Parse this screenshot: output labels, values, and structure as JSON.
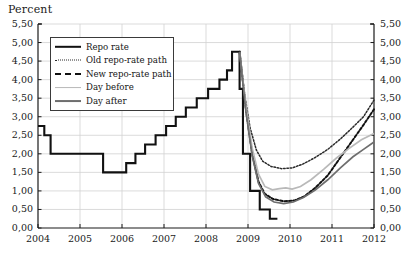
{
  "chart_data": {
    "type": "line",
    "title": "",
    "ylabel": "Percent",
    "xlabel": "",
    "ylim": [
      0,
      5.5
    ],
    "xlim": [
      2004,
      2012
    ],
    "grid": true,
    "legend_position": "top-left",
    "ytick_labels": [
      "0,00",
      "0,50",
      "1,00",
      "1,50",
      "2,00",
      "2,50",
      "3,00",
      "3,50",
      "4,00",
      "4,50",
      "5,00",
      "5,50"
    ],
    "ytick_values": [
      0,
      0.5,
      1,
      1.5,
      2,
      2.5,
      3,
      3.5,
      4,
      4.5,
      5,
      5.5
    ],
    "xtick_labels": [
      "2004",
      "2005",
      "2006",
      "2007",
      "2008",
      "2009",
      "2010",
      "2011",
      "2012"
    ],
    "xtick_values": [
      2004,
      2005,
      2006,
      2007,
      2008,
      2009,
      2010,
      2011,
      2012
    ],
    "series": [
      {
        "name": "Repo rate",
        "style": "solid-step",
        "color": "#111111",
        "width": 2.1,
        "points": [
          [
            2004.0,
            2.75
          ],
          [
            2004.15,
            2.75
          ],
          [
            2004.15,
            2.5
          ],
          [
            2004.3,
            2.5
          ],
          [
            2004.3,
            2.0
          ],
          [
            2005.55,
            2.0
          ],
          [
            2005.55,
            1.5
          ],
          [
            2006.1,
            1.5
          ],
          [
            2006.1,
            1.75
          ],
          [
            2006.32,
            1.75
          ],
          [
            2006.32,
            2.0
          ],
          [
            2006.55,
            2.0
          ],
          [
            2006.55,
            2.25
          ],
          [
            2006.8,
            2.25
          ],
          [
            2006.8,
            2.5
          ],
          [
            2007.05,
            2.5
          ],
          [
            2007.05,
            2.75
          ],
          [
            2007.28,
            2.75
          ],
          [
            2007.28,
            3.0
          ],
          [
            2007.52,
            3.0
          ],
          [
            2007.52,
            3.25
          ],
          [
            2007.78,
            3.25
          ],
          [
            2007.78,
            3.5
          ],
          [
            2008.05,
            3.5
          ],
          [
            2008.05,
            3.75
          ],
          [
            2008.32,
            3.75
          ],
          [
            2008.32,
            4.0
          ],
          [
            2008.5,
            4.0
          ],
          [
            2008.5,
            4.25
          ],
          [
            2008.62,
            4.25
          ],
          [
            2008.62,
            4.75
          ],
          [
            2008.8,
            4.75
          ],
          [
            2008.8,
            3.75
          ],
          [
            2008.88,
            3.75
          ],
          [
            2008.88,
            2.0
          ],
          [
            2009.05,
            2.0
          ],
          [
            2009.05,
            1.0
          ],
          [
            2009.28,
            1.0
          ],
          [
            2009.28,
            0.5
          ],
          [
            2009.52,
            0.5
          ],
          [
            2009.52,
            0.25
          ],
          [
            2009.7,
            0.25
          ]
        ]
      },
      {
        "name": "Old repo-rate path",
        "style": "dotted",
        "color": "#2b2b2b",
        "width": 1.5,
        "points": [
          [
            2008.8,
            4.75
          ],
          [
            2008.92,
            3.6
          ],
          [
            2009.05,
            2.7
          ],
          [
            2009.2,
            2.1
          ],
          [
            2009.35,
            1.8
          ],
          [
            2009.55,
            1.66
          ],
          [
            2009.8,
            1.6
          ],
          [
            2010.05,
            1.62
          ],
          [
            2010.3,
            1.72
          ],
          [
            2010.6,
            1.9
          ],
          [
            2010.9,
            2.12
          ],
          [
            2011.2,
            2.4
          ],
          [
            2011.5,
            2.72
          ],
          [
            2011.75,
            3.0
          ],
          [
            2012.0,
            3.45
          ]
        ]
      },
      {
        "name": "New repo-rate path",
        "style": "dashed-thick",
        "color": "#111111",
        "width": 2.0,
        "points": [
          [
            2008.8,
            4.75
          ],
          [
            2008.95,
            3.2
          ],
          [
            2009.1,
            2.0
          ],
          [
            2009.25,
            1.25
          ],
          [
            2009.4,
            0.92
          ],
          [
            2009.6,
            0.78
          ],
          [
            2009.85,
            0.72
          ],
          [
            2010.1,
            0.74
          ],
          [
            2010.35,
            0.86
          ],
          [
            2010.6,
            1.08
          ],
          [
            2010.9,
            1.42
          ],
          [
            2011.2,
            1.9
          ],
          [
            2011.5,
            2.38
          ],
          [
            2011.75,
            2.78
          ],
          [
            2012.0,
            3.2
          ]
        ]
      },
      {
        "name": "Day before",
        "style": "solid",
        "color": "#b9b9b9",
        "width": 1.7,
        "points": [
          [
            2008.8,
            4.75
          ],
          [
            2008.95,
            3.3
          ],
          [
            2009.1,
            2.15
          ],
          [
            2009.25,
            1.45
          ],
          [
            2009.4,
            1.12
          ],
          [
            2009.58,
            1.03
          ],
          [
            2009.75,
            1.06
          ],
          [
            2009.9,
            1.08
          ],
          [
            2010.05,
            1.05
          ],
          [
            2010.25,
            1.12
          ],
          [
            2010.5,
            1.3
          ],
          [
            2010.8,
            1.58
          ],
          [
            2011.1,
            1.88
          ],
          [
            2011.4,
            2.14
          ],
          [
            2011.7,
            2.38
          ],
          [
            2012.0,
            2.55
          ]
        ]
      },
      {
        "name": "Day after",
        "style": "solid",
        "color": "#6e6e6e",
        "width": 1.7,
        "points": [
          [
            2008.8,
            4.75
          ],
          [
            2008.95,
            3.15
          ],
          [
            2009.1,
            1.95
          ],
          [
            2009.25,
            1.2
          ],
          [
            2009.42,
            0.84
          ],
          [
            2009.62,
            0.7
          ],
          [
            2009.85,
            0.66
          ],
          [
            2010.08,
            0.7
          ],
          [
            2010.32,
            0.82
          ],
          [
            2010.6,
            1.02
          ],
          [
            2010.9,
            1.3
          ],
          [
            2011.2,
            1.62
          ],
          [
            2011.5,
            1.92
          ],
          [
            2011.75,
            2.12
          ],
          [
            2012.0,
            2.32
          ]
        ]
      }
    ]
  },
  "legend": {
    "items": [
      {
        "label": "Repo rate",
        "style": "solid-step",
        "color": "#111111"
      },
      {
        "label": "Old repo-rate path",
        "style": "dotted",
        "color": "#2b2b2b"
      },
      {
        "label": "New repo-rate path",
        "style": "dashed-thick",
        "color": "#111111"
      },
      {
        "label": "Day before",
        "style": "solid",
        "color": "#b9b9b9"
      },
      {
        "label": "Day after",
        "style": "solid",
        "color": "#6e6e6e"
      }
    ]
  },
  "colors": {
    "axis": "#1a1a1a",
    "grid": "#d2d2d2",
    "background": "#ffffff"
  }
}
